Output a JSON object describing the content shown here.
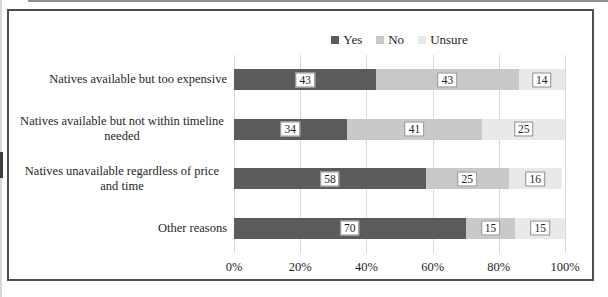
{
  "chart_data": {
    "type": "bar",
    "orientation": "horizontal",
    "stacked": true,
    "title": "",
    "categories": [
      "Natives available but too expensive",
      "Natives available but not within timeline needed",
      "Natives unavailable regardless of price and time",
      "Other reasons"
    ],
    "series": [
      {
        "name": "Yes",
        "color": "#5b5b5b",
        "values": [
          43,
          34,
          58,
          70
        ]
      },
      {
        "name": "No",
        "color": "#c9c9c9",
        "values": [
          43,
          41,
          25,
          15
        ]
      },
      {
        "name": "Unsure",
        "color": "#e9e9e9",
        "values": [
          14,
          25,
          16,
          15
        ]
      }
    ],
    "x_axis": {
      "min": 0,
      "max": 100,
      "tick_labels": [
        "0%",
        "20%",
        "40%",
        "60%",
        "80%",
        "100%"
      ]
    },
    "grid": true,
    "legend_position": "top-center",
    "data_labels": true,
    "data_label_style": "white box, thin border, centered in segment"
  },
  "colors": {
    "gridline": "#d9d9d9",
    "frame_border": "#4e4e4e",
    "text": "#1f1f1f"
  }
}
